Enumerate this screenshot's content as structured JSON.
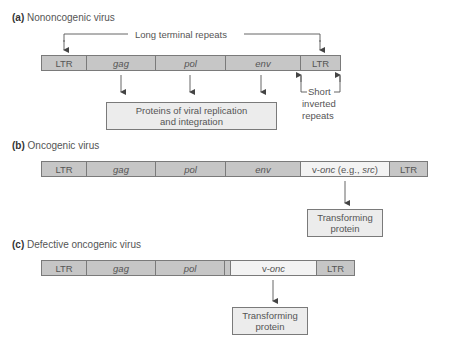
{
  "panels": {
    "a": {
      "letter": "(a)",
      "title": "Nononcogenic virus",
      "segments": [
        "LTR",
        "gag",
        "pol",
        "env",
        "LTR"
      ],
      "ltr_label": "Long terminal repeats",
      "protein_box": [
        "Proteins of viral replication",
        "and integration"
      ],
      "inverted_label": [
        "Short",
        "inverted",
        "repeats"
      ]
    },
    "b": {
      "letter": "(b)",
      "title": "Oncogenic virus",
      "segments": [
        "LTR",
        "gag",
        "pol",
        "env",
        "v-onc (e.g., src)",
        "LTR"
      ],
      "vonc_prefix": "v-",
      "vonc_italic": "onc",
      "vonc_mid": " (e.g., ",
      "vonc_src": "src",
      "vonc_end": ")",
      "protein_box": [
        "Transforming",
        "protein"
      ]
    },
    "c": {
      "letter": "(c)",
      "title": "Defective oncogenic virus",
      "segments": [
        "LTR",
        "gag",
        "pol",
        "",
        "v-onc",
        "LTR"
      ],
      "vonc_prefix": "v-",
      "vonc_italic": "onc",
      "protein_box": [
        "Transforming",
        "protein"
      ]
    }
  },
  "colors": {
    "segment_fill": "#c6c6c6",
    "light_fill": "#f3f3f3",
    "box_fill": "#ececec",
    "stroke": "#7a7a7a"
  }
}
